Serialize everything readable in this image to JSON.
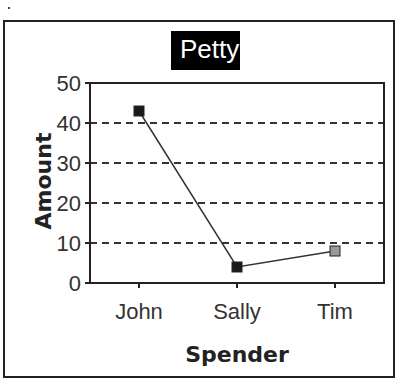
{
  "chart_data": {
    "type": "line",
    "title": "Petty",
    "xlabel": "Spender",
    "ylabel": "Amount",
    "categories": [
      "John",
      "Sally",
      "Tim"
    ],
    "series": [
      {
        "name": "Amount",
        "values": [
          43,
          4,
          8
        ],
        "marker_colors": [
          "#1a1a1a",
          "#1a1a1a",
          "#999999"
        ]
      }
    ],
    "ylim": [
      0,
      50
    ],
    "yticks": [
      0,
      10,
      20,
      30,
      40,
      50
    ],
    "grid": {
      "y": true,
      "style": "dashed"
    },
    "legend": null
  },
  "colors": {
    "line": "#333333",
    "grid": "#333333",
    "title_bg": "#000000",
    "title_fg": "#ffffff"
  }
}
